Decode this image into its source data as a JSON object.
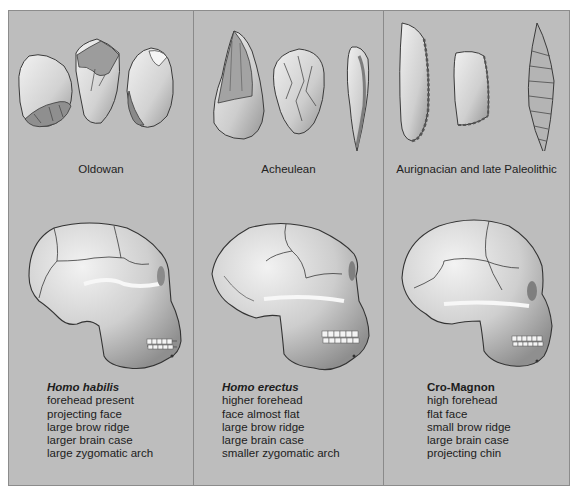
{
  "figure": {
    "panels": [
      {
        "tool_industry": "Oldowan",
        "species": "Homo habilis",
        "species_italic": true,
        "traits": [
          "forehead present",
          "projecting face",
          "large brow ridge",
          "larger brain case",
          "large zygomatic arch"
        ],
        "tool_count": 3
      },
      {
        "tool_industry": "Acheulean",
        "species": "Homo erectus",
        "species_italic": true,
        "traits": [
          "higher forehead",
          "face almost flat",
          "large brow ridge",
          "large brain case",
          "smaller zygomatic arch"
        ],
        "tool_count": 3
      },
      {
        "tool_industry": "Aurignacian and late Paleolithic",
        "species": "Cro-Magnon",
        "species_italic": false,
        "traits": [
          "high forehead",
          "flat face",
          "small brow ridge",
          "large brain case",
          "projecting chin"
        ],
        "tool_count": 3
      }
    ],
    "colors": {
      "panel_background": "#bdbdbd",
      "divider": "#8a8a8a",
      "outline": "#3a3a3a",
      "bone_light": "#ececec",
      "bone_mid": "#c9c9c9",
      "bone_shadow": "#8f8f8f"
    }
  }
}
